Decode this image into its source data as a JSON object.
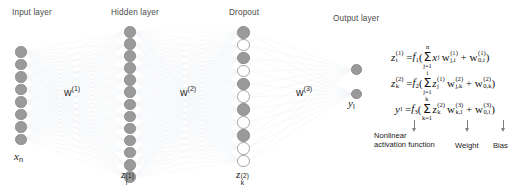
{
  "diagram": {
    "layers": [
      {
        "id": "input",
        "label": "Input layer",
        "node_label": "x",
        "node_label_sub": "n",
        "node_count": 8,
        "dropout": false
      },
      {
        "id": "hidden",
        "label": "Hidden layer",
        "node_label": "z",
        "node_label_sub": "i",
        "node_label_sup": "(1)",
        "node_count": 13,
        "dropout": false
      },
      {
        "id": "dropout",
        "label": "Dropout",
        "node_label": "z",
        "node_label_sub": "k",
        "node_label_sup": "(2)",
        "node_count": 11,
        "dropout": true,
        "dropped_pattern": [
          false,
          true,
          false,
          true,
          false,
          true,
          false,
          true,
          false,
          true,
          true
        ]
      },
      {
        "id": "output",
        "label": "Output layer",
        "node_label": "y",
        "node_label_sub": "l",
        "node_count": 2,
        "dropout": false
      }
    ],
    "weight_labels": [
      {
        "id": "w1",
        "base": "w",
        "sup": "(1)"
      },
      {
        "id": "w2",
        "base": "w",
        "sup": "(2)"
      },
      {
        "id": "w3",
        "base": "w",
        "sup": "(3)"
      }
    ],
    "equations": [
      {
        "id": "eq-z1",
        "lhs_base": "z",
        "lhs_sup": "(1)",
        "lhs_sub": "i",
        "equals": "=",
        "func": "f",
        "func_sub": "1",
        "open": "(",
        "sum_upper": "n",
        "sum_lower": "j=1",
        "term1_base": "x",
        "term1_sub": "j",
        "term2_base": "w",
        "term2_sup": "(1)",
        "term2_sub": "j,i",
        "plus": "+",
        "bias_base": "w",
        "bias_sup": "(1)",
        "bias_sub": "0,i",
        "close": ")"
      },
      {
        "id": "eq-z2",
        "lhs_base": "z",
        "lhs_sup": "(2)",
        "lhs_sub": "k",
        "equals": "=",
        "func": "f",
        "func_sub": "2",
        "open": "(",
        "sum_upper": "i",
        "sum_lower": "j=1",
        "term1_base": "z",
        "term1_sup": "(1)",
        "term1_sub": "j",
        "term2_base": "w",
        "term2_sup": "(2)",
        "term2_sub": "j,k",
        "plus": "+",
        "bias_base": "w",
        "bias_sup": "(2)",
        "bias_sub": "0,k",
        "close": ")"
      },
      {
        "id": "eq-y",
        "lhs_base": "y",
        "lhs_sub": "l",
        "equals": "=",
        "func": "f",
        "func_sub": "3",
        "open": "(",
        "sum_upper": "k",
        "sum_lower": "k=1",
        "term1_base": "z",
        "term1_sup": "(2)",
        "term1_sub": "k",
        "term2_base": "w",
        "term2_sup": "(3)",
        "term2_sub": "k,l",
        "plus": "+",
        "bias_base": "w",
        "bias_sup": "(3)",
        "bias_sub": "0,l",
        "close": ")"
      }
    ],
    "annotations": [
      {
        "id": "ann-activation",
        "line1": "Nonlinear",
        "line2": "activation function"
      },
      {
        "id": "ann-weight",
        "line1": "Weight",
        "line2": ""
      },
      {
        "id": "ann-bias",
        "line1": "Bias",
        "line2": ""
      }
    ],
    "colors": {
      "node_fill": "#9a9a9a",
      "node_stroke": "#8d8d8d",
      "node_hollow_stroke": "#a8a8a8",
      "edge": "#c9d3e0",
      "text": "#1a1a1a",
      "label_text": "#4a4a4a",
      "arrow": "#808080",
      "background": "#ffffff"
    }
  }
}
